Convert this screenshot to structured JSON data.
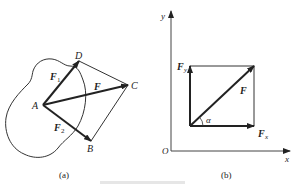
{
  "figure_a": {
    "caption": "(a)",
    "points": {
      "A": "A",
      "B": "B",
      "C": "C",
      "D": "D"
    },
    "forces": {
      "F1": "F",
      "F1_sub": "1",
      "F2": "F",
      "F2_sub": "2",
      "F": "F"
    }
  },
  "figure_b": {
    "caption": "(b)",
    "axes": {
      "x": "x",
      "y": "y",
      "origin": "O"
    },
    "forces": {
      "F": "F",
      "Fx": "F",
      "Fx_sub": "x",
      "Fy": "F",
      "Fy_sub": "y"
    },
    "angle": "α"
  },
  "colors": {
    "ink": "#222222",
    "light_line": "#555555",
    "background": "#ffffff"
  }
}
